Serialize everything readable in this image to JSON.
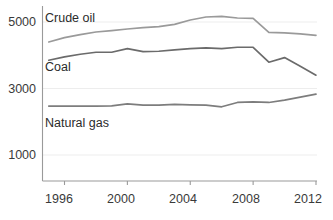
{
  "chart_data": {
    "type": "line",
    "title": "",
    "subtitle": "",
    "xlabel": "",
    "ylabel": "",
    "xlim": [
      1994.6,
      2012
    ],
    "ylim": [
      0,
      5600
    ],
    "grid": true,
    "grid_axis": "y",
    "legend_position": "inline-labels",
    "yticks": [
      1000,
      3000,
      5000
    ],
    "ytick_labels": [
      "1000",
      "3000",
      "5000"
    ],
    "xticks": [
      1996,
      2000,
      2004,
      2008,
      2012
    ],
    "xtick_labels": [
      "1996",
      "2000",
      "2004",
      "2008",
      "2012"
    ],
    "x": [
      1995,
      1996,
      1997,
      1998,
      1999,
      2000,
      2001,
      2002,
      2003,
      2004,
      2005,
      2006,
      2007,
      2008,
      2009,
      2010,
      2011,
      2012
    ],
    "series": [
      {
        "name": "Crude oil",
        "color": "#9a9a9a",
        "label_x": 1995.2,
        "label_y": 5160,
        "values": [
          4400,
          4530,
          4620,
          4700,
          4740,
          4790,
          4830,
          4860,
          4930,
          5060,
          5150,
          5170,
          5120,
          5110,
          4690,
          4670,
          4640,
          4600
        ]
      },
      {
        "name": "Coal",
        "color": "#6b6b6b",
        "label_x": 1995.2,
        "label_y": 3620,
        "values": [
          3850,
          3950,
          4030,
          4090,
          4090,
          4200,
          4110,
          4120,
          4160,
          4200,
          4220,
          4200,
          4240,
          4240,
          3790,
          3930,
          3670,
          3400
        ]
      },
      {
        "name": "Natural gas",
        "color": "#7d7d7d",
        "label_x": 1995.2,
        "label_y": 2010,
        "values": [
          2470,
          2470,
          2470,
          2470,
          2480,
          2540,
          2500,
          2500,
          2520,
          2510,
          2500,
          2450,
          2580,
          2600,
          2580,
          2650,
          2740,
          2830
        ]
      }
    ],
    "axis_color": "#9a9a9a",
    "gridline_color": "#ededed",
    "text_color": "#3a3a3a"
  }
}
